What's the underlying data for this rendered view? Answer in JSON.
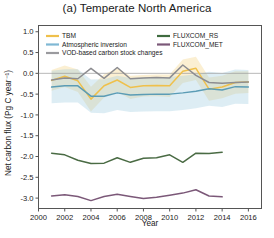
{
  "chart_data": {
    "type": "line",
    "title": "(a) Temperate North America",
    "xlabel": "Year",
    "ylabel": "Net carbon flux (Pg C year⁻¹)",
    "xlim": [
      2000,
      2017
    ],
    "ylim": [
      -3.25,
      1.15
    ],
    "xticks": [
      2000,
      2002,
      2004,
      2006,
      2008,
      2010,
      2012,
      2014,
      2016
    ],
    "xtick_labels": [
      "2000",
      "2002",
      "2004",
      "2006",
      "2008",
      "2010",
      "2012",
      "2014",
      "2016"
    ],
    "yticks": [
      1.0,
      0.5,
      0.0,
      -0.5,
      -1.0,
      -1.5,
      -2.0,
      -2.5,
      -3.0
    ],
    "ytick_labels": [
      "1.0",
      "0.5",
      "0.0",
      "-0.5",
      "-1.0",
      "-1.5",
      "-2.0",
      "-2.5",
      "-3.0"
    ],
    "grid": false,
    "zero_line": true,
    "legend_position": "upper-inside-top",
    "series": [
      {
        "name": "TBM",
        "color": "#efc04b",
        "band_color": "#efc04b",
        "band_opacity": 0.25,
        "x": [
          2001,
          2002,
          2003,
          2004,
          2005,
          2006,
          2007,
          2008,
          2009,
          2010,
          2011,
          2012,
          2013,
          2014,
          2015,
          2016
        ],
        "values": [
          -0.17,
          -0.07,
          -0.18,
          -0.62,
          -0.3,
          -0.16,
          -0.34,
          -0.3,
          -0.29,
          -0.3,
          0.05,
          0.12,
          -0.38,
          -0.33,
          -0.22,
          -0.21
        ],
        "band_lo": [
          -0.42,
          -0.33,
          -0.45,
          -0.92,
          -0.58,
          -0.44,
          -0.62,
          -0.56,
          -0.55,
          -0.57,
          -0.23,
          -0.16,
          -0.66,
          -0.6,
          -0.49,
          -0.47
        ],
        "band_hi": [
          0.08,
          0.19,
          0.09,
          -0.32,
          -0.02,
          0.12,
          -0.06,
          -0.04,
          -0.03,
          -0.03,
          0.33,
          0.4,
          -0.1,
          -0.06,
          0.05,
          0.05
        ]
      },
      {
        "name": "Atmospheric inversion",
        "color": "#5b9cb5",
        "band_color": "#9dcbe0",
        "band_opacity": 0.35,
        "x": [
          2001,
          2002,
          2003,
          2004,
          2005,
          2006,
          2007,
          2008,
          2009,
          2010,
          2011,
          2012,
          2013,
          2014,
          2015,
          2016
        ],
        "values": [
          -0.33,
          -0.3,
          -0.3,
          -0.55,
          -0.55,
          -0.47,
          -0.52,
          -0.51,
          -0.5,
          -0.5,
          -0.47,
          -0.43,
          -0.37,
          -0.4,
          -0.32,
          -0.33
        ],
        "band_lo": [
          -0.72,
          -0.7,
          -0.7,
          -0.95,
          -0.96,
          -0.88,
          -0.93,
          -0.92,
          -0.91,
          -0.91,
          -0.88,
          -0.84,
          -0.78,
          -0.81,
          -0.73,
          -0.74
        ],
        "band_hi": [
          0.06,
          0.1,
          0.1,
          -0.15,
          -0.14,
          -0.06,
          -0.11,
          -0.1,
          -0.09,
          -0.09,
          -0.06,
          -0.02,
          0.04,
          0.01,
          0.09,
          0.08
        ]
      },
      {
        "name": "VOD-based carbon stock changes",
        "color": "#8d8d91",
        "band_color": "#b9b9bd",
        "band_opacity": 0.22,
        "x": [
          2001,
          2002,
          2003,
          2004,
          2005,
          2006,
          2007,
          2008,
          2009,
          2010,
          2011,
          2012,
          2013,
          2014,
          2015,
          2016
        ],
        "values": [
          -0.16,
          -0.11,
          -0.13,
          0.12,
          -0.12,
          0.14,
          -0.13,
          -0.11,
          -0.1,
          -0.11,
          0.2,
          -0.05,
          -0.22,
          -0.24,
          -0.22,
          -0.21
        ],
        "band_lo": [
          -0.16,
          -0.11,
          -0.13,
          0.12,
          -0.12,
          0.14,
          -0.13,
          -0.11,
          -0.1,
          -0.11,
          0.2,
          -0.05,
          -0.22,
          -0.24,
          -0.22,
          -0.21
        ],
        "band_hi": [
          -0.16,
          -0.11,
          -0.13,
          0.12,
          -0.12,
          0.14,
          -0.13,
          -0.11,
          -0.1,
          -0.11,
          0.2,
          -0.05,
          -0.22,
          -0.24,
          -0.22,
          -0.21
        ]
      },
      {
        "name": "FLUXCOM_RS",
        "color": "#4a6b44",
        "x": [
          2001,
          2002,
          2003,
          2004,
          2005,
          2006,
          2007,
          2008,
          2009,
          2010,
          2011,
          2012,
          2013,
          2014
        ],
        "values": [
          -1.92,
          -1.96,
          -2.09,
          -2.17,
          -2.16,
          -2.03,
          -2.14,
          -2.04,
          -2.03,
          -1.96,
          -2.14,
          -1.92,
          -1.93,
          -1.9
        ]
      },
      {
        "name": "FLUXCOM_MET",
        "color": "#7b5878",
        "x": [
          2001,
          2002,
          2003,
          2004,
          2005,
          2006,
          2007,
          2008,
          2009,
          2010,
          2011,
          2012,
          2013,
          2014
        ],
        "values": [
          -2.95,
          -2.92,
          -2.96,
          -3.06,
          -2.96,
          -2.91,
          -2.96,
          -3.01,
          -2.98,
          -2.93,
          -2.88,
          -2.8,
          -2.95,
          -2.97
        ]
      }
    ],
    "legend_items": [
      {
        "label": "TBM",
        "color": "#efc04b",
        "column": 0,
        "row": 0
      },
      {
        "label": "Atmospheric inversion",
        "color": "#7fb8d4",
        "column": 0,
        "row": 1
      },
      {
        "label": "VOD-based carbon stock changes",
        "color": "#9a9a9e",
        "column": 0,
        "row": 2
      },
      {
        "label": "FLUXCOM_RS",
        "color": "#3f6b3f",
        "column": 1,
        "row": 0
      },
      {
        "label": "FLUXCOM_MET",
        "color": "#7b5878",
        "column": 1,
        "row": 1
      }
    ]
  }
}
